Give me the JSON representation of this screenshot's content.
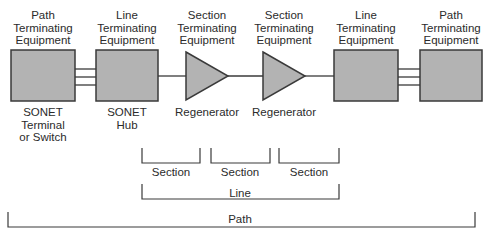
{
  "diagram": {
    "colors": {
      "fill": "#b3b3b3",
      "stroke": "#3a3a3a",
      "background": "#ffffff"
    },
    "top_labels": [
      {
        "text": "Path\nTerminating\nEquipment",
        "x": 43
      },
      {
        "text": "Line\nTerminating\nEquipment",
        "x": 127
      },
      {
        "text": "Section\nTerminating\nEquipment",
        "x": 207
      },
      {
        "text": "Section\nTerminating\nEquipment",
        "x": 284
      },
      {
        "text": "Line\nTerminating\nEquipment",
        "x": 366
      },
      {
        "text": "Path\nTerminating\nEquipment",
        "x": 451
      }
    ],
    "bottom_labels": [
      {
        "text": "SONET\nTerminal\nor Switch",
        "x": 43
      },
      {
        "text": "SONET\nHub",
        "x": 127
      },
      {
        "text": "Regenerator",
        "x": 207
      },
      {
        "text": "Regenerator",
        "x": 284
      }
    ],
    "spans": {
      "sections": [
        "Section",
        "Section",
        "Section"
      ],
      "line": "Line",
      "path": "Path"
    }
  }
}
